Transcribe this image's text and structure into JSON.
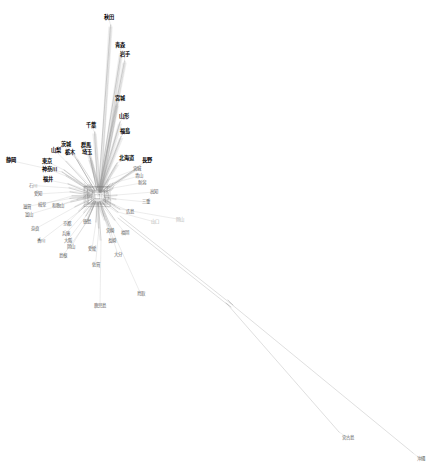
{
  "figure": {
    "type": "phylogenetic-split-network",
    "title": "",
    "background_color": "#ffffff",
    "edge_color": "#9a9a9a",
    "edge_color_dark": "#6a6a6a",
    "width": 434,
    "height": 473,
    "center": {
      "x": 98,
      "y": 196
    }
  },
  "network_data": {
    "type": "splits-network",
    "description": "NeighborNet-style split decomposition network of Japanese prefectures with a dense reticulate core and long divergent branches",
    "hub": {
      "x": 98,
      "y": 196
    },
    "label_count": 49,
    "leaves": [
      {
        "name": "秋田",
        "x": 108.5,
        "y": 17.5,
        "tip_x": 110.5,
        "tip_y": 25.0,
        "weight": "bold",
        "style": "bold"
      },
      {
        "name": "青森",
        "x": 119.5,
        "y": 45.5,
        "tip_x": 121.0,
        "tip_y": 52.0,
        "weight": "bold",
        "style": "bold"
      },
      {
        "name": "岩手",
        "x": 125.0,
        "y": 54.5,
        "tip_x": 124.5,
        "tip_y": 61.0,
        "weight": "bold",
        "style": "bold"
      },
      {
        "name": "宮城",
        "x": 120.0,
        "y": 98.5,
        "tip_x": 117.0,
        "tip_y": 104.0,
        "weight": "bold",
        "style": "bold"
      },
      {
        "name": "山形",
        "x": 123.5,
        "y": 117.0,
        "tip_x": 120.0,
        "tip_y": 122.0,
        "weight": "bold",
        "style": "bold"
      },
      {
        "name": "福島",
        "x": 125.0,
        "y": 131.5,
        "tip_x": 121.0,
        "tip_y": 136.5,
        "weight": "bold",
        "style": "bold"
      },
      {
        "name": "千葉",
        "x": 91.0,
        "y": 125.5,
        "tip_x": 94.5,
        "tip_y": 132.0,
        "weight": "bold",
        "style": "bold"
      },
      {
        "name": "北海道",
        "x": 126.0,
        "y": 158.5,
        "tip_x": 117.0,
        "tip_y": 163.0,
        "weight": "bold",
        "style": "bold"
      },
      {
        "name": "長野",
        "x": 146.5,
        "y": 160.5,
        "tip_x": 139.0,
        "tip_y": 166.0,
        "weight": "bold",
        "style": "bold"
      },
      {
        "name": "群馬",
        "x": 86.0,
        "y": 146.0,
        "tip_x": 89.0,
        "tip_y": 152.5,
        "weight": "bold",
        "style": "bold"
      },
      {
        "name": "埼玉",
        "x": 87.0,
        "y": 152.5,
        "tip_x": 90.5,
        "tip_y": 158.5,
        "weight": "bold",
        "style": "bold"
      },
      {
        "name": "茨城",
        "x": 66.0,
        "y": 145.0,
        "tip_x": 74.0,
        "tip_y": 155.0,
        "weight": "bold",
        "style": "bold"
      },
      {
        "name": "栃木",
        "x": 70.0,
        "y": 152.5,
        "tip_x": 77.0,
        "tip_y": 160.0,
        "weight": "bold",
        "style": "bold"
      },
      {
        "name": "山梨",
        "x": 55.5,
        "y": 151.0,
        "tip_x": 66.0,
        "tip_y": 161.5,
        "weight": "bold",
        "style": "bold"
      },
      {
        "name": "静岡",
        "x": 10.5,
        "y": 160.5,
        "tip_x": 62.0,
        "tip_y": 172.0,
        "weight": "bold",
        "style": "bold"
      },
      {
        "name": "東京",
        "x": 47.0,
        "y": 161.5,
        "tip_x": 64.0,
        "tip_y": 170.0,
        "weight": "bold",
        "style": "bold"
      },
      {
        "name": "神奈川",
        "x": 49.0,
        "y": 169.5,
        "tip_x": 66.0,
        "tip_y": 176.0,
        "weight": "bold",
        "style": "bold"
      },
      {
        "name": "福井",
        "x": 48.0,
        "y": 180.0,
        "tip_x": 68.0,
        "tip_y": 184.0,
        "weight": "bold",
        "style": "bold"
      },
      {
        "name": "石川",
        "x": 33.0,
        "y": 185.5,
        "tip_x": 69.0,
        "tip_y": 188.0,
        "weight": "grey",
        "style": "grey"
      },
      {
        "name": "愛知",
        "x": 38.0,
        "y": 194.0,
        "tip_x": 70.0,
        "tip_y": 192.0,
        "weight": "mid",
        "style": "mid"
      },
      {
        "name": "岐阜",
        "x": 42.0,
        "y": 204.5,
        "tip_x": 72.0,
        "tip_y": 196.0,
        "weight": "mid",
        "style": "mid"
      },
      {
        "name": "滋賀",
        "x": 27.0,
        "y": 206.5,
        "tip_x": 70.0,
        "tip_y": 198.5,
        "weight": "mid",
        "style": "mid"
      },
      {
        "name": "和歌山",
        "x": 58.0,
        "y": 205.5,
        "tip_x": 77.0,
        "tip_y": 199.5,
        "weight": "mid",
        "style": "mid"
      },
      {
        "name": "富山",
        "x": 29.0,
        "y": 214.5,
        "tip_x": 71.0,
        "tip_y": 202.0,
        "weight": "mid",
        "style": "mid"
      },
      {
        "name": "奈良",
        "x": 35.0,
        "y": 229.0,
        "tip_x": 75.0,
        "tip_y": 207.0,
        "weight": "mid",
        "style": "mid"
      },
      {
        "name": "香川",
        "x": 41.0,
        "y": 240.5,
        "tip_x": 79.0,
        "tip_y": 211.5,
        "weight": "mid",
        "style": "mid"
      },
      {
        "name": "京都",
        "x": 67.0,
        "y": 224.0,
        "tip_x": 82.0,
        "tip_y": 208.5,
        "weight": "mid",
        "style": "mid"
      },
      {
        "name": "兵庫",
        "x": 66.0,
        "y": 233.5,
        "tip_x": 84.0,
        "tip_y": 213.0,
        "weight": "mid",
        "style": "mid"
      },
      {
        "name": "大阪",
        "x": 67.5,
        "y": 240.5,
        "tip_x": 86.0,
        "tip_y": 216.0,
        "weight": "mid",
        "style": "mid"
      },
      {
        "name": "岡山",
        "x": 71.0,
        "y": 247.0,
        "tip_x": 88.0,
        "tip_y": 219.0,
        "weight": "mid",
        "style": "mid"
      },
      {
        "name": "島根",
        "x": 63.0,
        "y": 255.5,
        "tip_x": 87.0,
        "tip_y": 222.0,
        "weight": "mid",
        "style": "mid"
      },
      {
        "name": "徳島",
        "x": 86.5,
        "y": 222.0,
        "tip_x": 92.0,
        "tip_y": 210.0,
        "weight": "mid",
        "style": "mid"
      },
      {
        "name": "愛媛",
        "x": 92.0,
        "y": 249.0,
        "tip_x": 96.0,
        "tip_y": 222.0,
        "weight": "mid",
        "style": "mid"
      },
      {
        "name": "佐賀",
        "x": 95.5,
        "y": 264.5,
        "tip_x": 99.0,
        "tip_y": 228.0,
        "weight": "mid",
        "style": "mid"
      },
      {
        "name": "鹿児島",
        "x": 100.0,
        "y": 305.5,
        "tip_x": 101.0,
        "tip_y": 240.0,
        "weight": "mid",
        "style": "mid"
      },
      {
        "name": "長崎",
        "x": 112.0,
        "y": 240.5,
        "tip_x": 105.0,
        "tip_y": 220.0,
        "weight": "mid",
        "style": "mid"
      },
      {
        "name": "宮崎",
        "x": 110.0,
        "y": 231.0,
        "tip_x": 104.0,
        "tip_y": 216.0,
        "weight": "mid",
        "style": "mid"
      },
      {
        "name": "大分",
        "x": 118.0,
        "y": 255.0,
        "tip_x": 109.0,
        "tip_y": 226.0,
        "weight": "mid",
        "style": "mid"
      },
      {
        "name": "鳥取",
        "x": 140.5,
        "y": 293.5,
        "tip_x": 113.0,
        "tip_y": 232.0,
        "weight": "mid",
        "style": "mid"
      },
      {
        "name": "福岡",
        "x": 124.5,
        "y": 232.5,
        "tip_x": 115.0,
        "tip_y": 220.0,
        "weight": "mid",
        "style": "mid"
      },
      {
        "name": "広島",
        "x": 130.0,
        "y": 211.5,
        "tip_x": 115.0,
        "tip_y": 205.0,
        "weight": "mid",
        "style": "mid"
      },
      {
        "name": "三重",
        "x": 146.0,
        "y": 202.0,
        "tip_x": 116.0,
        "tip_y": 199.0,
        "weight": "mid",
        "style": "mid"
      },
      {
        "name": "高知",
        "x": 154.0,
        "y": 192.0,
        "tip_x": 117.0,
        "tip_y": 195.0,
        "weight": "mid",
        "style": "mid"
      },
      {
        "name": "新潟",
        "x": 141.5,
        "y": 183.0,
        "tip_x": 113.0,
        "tip_y": 188.0,
        "weight": "mid",
        "style": "mid"
      },
      {
        "name": "青山",
        "x": 139.0,
        "y": 176.0,
        "tip_x": 110.0,
        "tip_y": 184.0,
        "weight": "mid",
        "style": "mid"
      },
      {
        "name": "宮城2",
        "x": 136.5,
        "y": 169.0,
        "tip_x": 108.0,
        "tip_y": 180.0,
        "weight": "mid",
        "style": "mid"
      },
      {
        "name": "山口",
        "x": 155.0,
        "y": 222.0,
        "tip_x": 118.0,
        "tip_y": 212.0,
        "weight": "faint",
        "style": "faint"
      },
      {
        "name": "岡山2",
        "x": 180.0,
        "y": 219.5,
        "tip_x": 120.0,
        "tip_y": 209.0,
        "weight": "faint",
        "style": "faint"
      },
      {
        "name": "宮古島",
        "x": 348.0,
        "y": 438.0,
        "tip_x": 339.0,
        "tip_y": 432.0,
        "weight": "mid",
        "style": "mid"
      },
      {
        "name": "沖縄",
        "x": 420.5,
        "y": 459.0,
        "tip_x": 413.0,
        "tip_y": 453.0,
        "weight": "mid",
        "style": "mid"
      }
    ],
    "long_branches": [
      {
        "from_x": 118,
        "from_y": 218,
        "split_x": 228,
        "split_y": 305,
        "to_x": 339,
        "to_y": 432,
        "label": "宮古島"
      },
      {
        "from_x": 120,
        "from_y": 216,
        "split_x": 230,
        "split_y": 303,
        "to_x": 413,
        "to_y": 453,
        "label": "沖縄"
      }
    ]
  }
}
